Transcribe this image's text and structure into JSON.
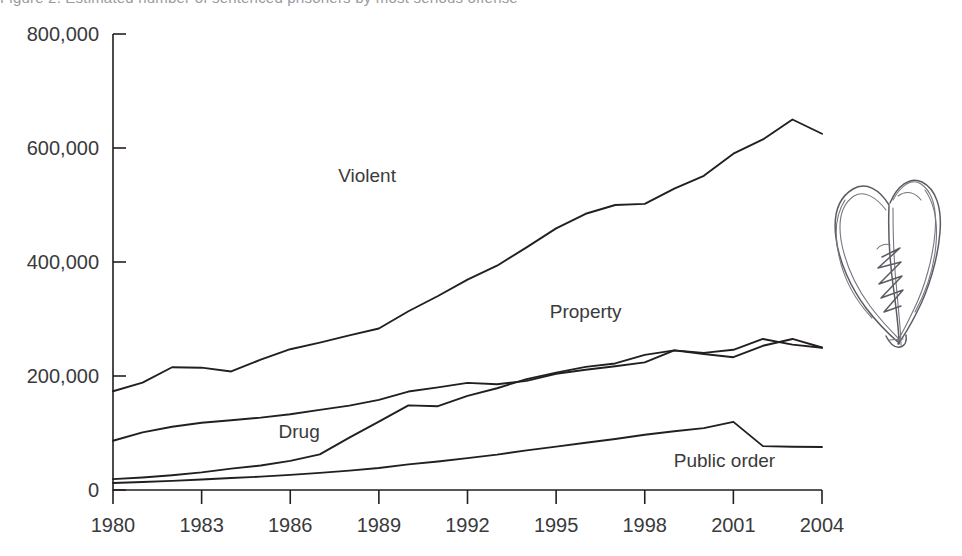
{
  "top_clipped_text": "Figure 2. Estimated number of sentenced prisoners by most serious offense",
  "annotation": {
    "name": "hand-drawn-heart-sketch",
    "description": "hand drawn broken heart with zigzag stitches"
  },
  "chart_data": {
    "type": "line",
    "title": "",
    "xlabel": "",
    "ylabel": "",
    "x": [
      1980,
      1981,
      1982,
      1983,
      1984,
      1985,
      1986,
      1987,
      1988,
      1989,
      1990,
      1991,
      1992,
      1993,
      1994,
      1995,
      1996,
      1997,
      1998,
      1999,
      2000,
      2001,
      2002,
      2003,
      2004
    ],
    "xticks": [
      "1980",
      "1983",
      "1986",
      "1989",
      "1992",
      "1995",
      "1998",
      "2001",
      "2004"
    ],
    "yticks": [
      "0",
      "200,000",
      "400,000",
      "600,000",
      "800,000"
    ],
    "ylim": [
      0,
      800000
    ],
    "xlim": [
      1980,
      2004
    ],
    "grid": false,
    "legend": "inline-labels",
    "series": [
      {
        "name": "Violent",
        "label": "Violent",
        "color": "#231f20",
        "label_x": 1988.6,
        "label_y": 540000,
        "values": [
          173300,
          188500,
          215300,
          214600,
          208000,
          228600,
          247000,
          258600,
          271300,
          283300,
          313600,
          340300,
          369100,
          393500,
          425700,
          459000,
          484600,
          500000,
          502000,
          528600,
          551200,
          590000,
          615000,
          650000,
          625000
        ]
      },
      {
        "name": "Property",
        "label": "Property",
        "color": "#231f20",
        "label_x": 1996.0,
        "label_y": 302000,
        "values": [
          86400,
          101000,
          111000,
          118000,
          122500,
          127000,
          133000,
          140500,
          148000,
          158000,
          172700,
          180000,
          188000,
          185500,
          191500,
          204000,
          211000,
          217000,
          224000,
          245000,
          238500,
          233000,
          253000,
          265000,
          250000
        ]
      },
      {
        "name": "Drug",
        "label": "Drug",
        "color": "#231f20",
        "label_x": 1986.3,
        "label_y": 92000,
        "values": [
          19000,
          22000,
          26000,
          31000,
          37500,
          43000,
          51000,
          62500,
          92000,
          120000,
          148500,
          147000,
          165000,
          178500,
          194500,
          206000,
          216000,
          222000,
          237000,
          245000,
          240500,
          246000,
          265000,
          255000,
          249500
        ]
      },
      {
        "name": "Public order",
        "label": "Public order",
        "color": "#231f20",
        "label_x": 2000.7,
        "label_y": 40000,
        "values": [
          12400,
          14000,
          16000,
          18500,
          21000,
          23500,
          26500,
          30000,
          34000,
          38500,
          45000,
          50000,
          56000,
          62000,
          69500,
          76000,
          83000,
          89500,
          97000,
          103000,
          108500,
          119500,
          77000,
          76000,
          75500
        ]
      }
    ]
  }
}
